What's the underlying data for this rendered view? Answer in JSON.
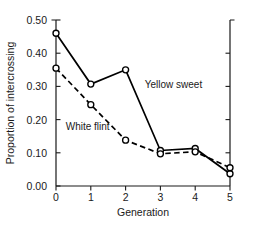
{
  "chart_data": {
    "type": "line",
    "title": "",
    "xlabel": "Generation",
    "ylabel": "Proportion of intercrossing",
    "x": [
      0,
      1,
      2,
      3,
      4,
      5
    ],
    "xtick_labels": [
      "0",
      "1",
      "2",
      "3",
      "4",
      "5"
    ],
    "ytick_labels": [
      "0.00",
      "0.10",
      "0.20",
      "0.30",
      "0.40",
      "0.50"
    ],
    "ytick_values": [
      0.0,
      0.1,
      0.2,
      0.3,
      0.4,
      0.5
    ],
    "xlim": [
      0,
      5
    ],
    "ylim": [
      0.0,
      0.5
    ],
    "grid": false,
    "legend_position": "inline-annotations",
    "series": [
      {
        "name": "Yellow sweet",
        "style": "solid",
        "marker": "open-circle",
        "color": "#000000",
        "values": [
          0.46,
          0.307,
          0.35,
          0.107,
          0.113,
          0.037
        ],
        "label_x": 2.55,
        "label_y": 0.295
      },
      {
        "name": "White flint",
        "style": "dashed",
        "marker": "open-circle",
        "color": "#000000",
        "values": [
          0.355,
          0.245,
          0.138,
          0.097,
          0.103,
          0.055
        ],
        "label_x": 0.28,
        "label_y": 0.168
      }
    ]
  },
  "annotations": {
    "series_1_label": "Yellow sweet",
    "series_2_label": "White flint"
  }
}
